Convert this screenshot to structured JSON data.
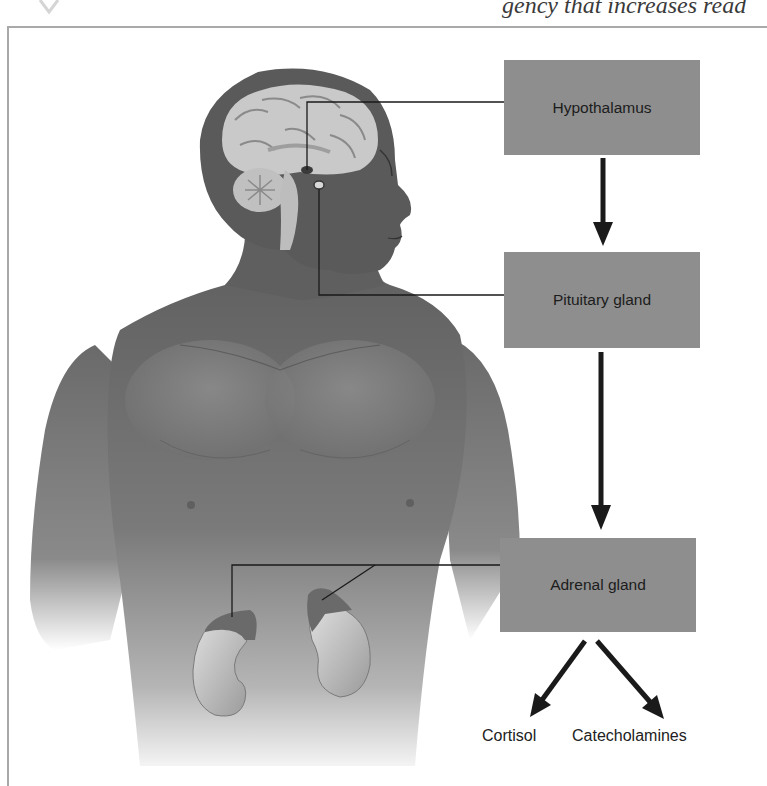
{
  "page": {
    "header_fragment": "gency that increases read"
  },
  "diagram": {
    "title": "",
    "nodes": [
      {
        "id": "hypothalamus",
        "label": "Hypothalamus"
      },
      {
        "id": "pituitary",
        "label": "Pituitary gland"
      },
      {
        "id": "adrenal",
        "label": "Adrenal gland"
      },
      {
        "id": "cortisol",
        "label": "Cortisol"
      },
      {
        "id": "catecholamines",
        "label": "Catecholamines"
      }
    ],
    "edges": [
      {
        "from": "hypothalamus",
        "to": "pituitary"
      },
      {
        "from": "pituitary",
        "to": "adrenal"
      },
      {
        "from": "adrenal",
        "to": "cortisol"
      },
      {
        "from": "adrenal",
        "to": "catecholamines"
      }
    ],
    "illustration": "Male torso with sagittal brain section and kidneys with adrenal glands",
    "colors": {
      "box_fill": "#8e8e8e",
      "arrow": "#1a1a1a",
      "skin": "#6f6f6f",
      "brain": "#c9c9c9"
    }
  }
}
